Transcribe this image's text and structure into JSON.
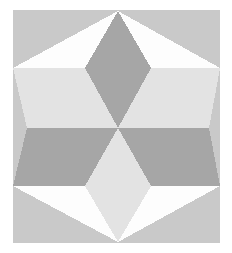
{
  "figure": {
    "title": "Six-Pointed Star Quilt Block",
    "type": "geometric-pattern",
    "canvas": {
      "width": 232,
      "height": 253,
      "page_background": "#ffffff"
    },
    "plate": {
      "label": "pattern-plate",
      "x": 13,
      "y": 10,
      "width": 207,
      "height": 233,
      "background_color": "#c9c9c9"
    },
    "palette": {
      "page_white": "#ffffff",
      "plate_gray": "#c9c9c9",
      "dark_gray": "#a6a6a6",
      "light_gray": "#e3e3e3",
      "void_white": "#fdfdfd"
    },
    "geometry": {
      "top_apex": {
        "x": 118,
        "y": 11
      },
      "center": {
        "x": 118,
        "y": 128
      },
      "bottom_apex": {
        "x": 118,
        "y": 242
      },
      "left_waist": {
        "x": 27,
        "y": 128
      },
      "right_waist": {
        "x": 209,
        "y": 128
      },
      "upper_band_top_y": 68,
      "lower_band_bottom_y": 186,
      "diamond_half_width": 33
    },
    "shapes": [
      {
        "name": "upper-dark-diamond",
        "fill": "#a6a6a6",
        "points": "118,11 151,68 118,128 85,68"
      },
      {
        "name": "upper-left-light-wing",
        "fill": "#e3e3e3",
        "points": "13,68 85,68 118,128 27,128"
      },
      {
        "name": "upper-right-light-wing",
        "fill": "#e3e3e3",
        "points": "151,68 220,68 209,128 118,128"
      },
      {
        "name": "lower-left-dark-wing",
        "fill": "#a6a6a6",
        "points": "27,128 118,128 85,186 13,186"
      },
      {
        "name": "lower-right-dark-wing",
        "fill": "#a6a6a6",
        "points": "118,128 209,128 220,186 151,186"
      },
      {
        "name": "lower-light-diamond",
        "fill": "#e3e3e3",
        "points": "118,128 151,186 118,242 85,186"
      },
      {
        "name": "top-left-white-void",
        "fill": "#fdfdfd",
        "points": "13,68 118,11 85,68"
      },
      {
        "name": "top-right-white-void",
        "fill": "#fdfdfd",
        "points": "118,11 220,68 151,68"
      },
      {
        "name": "bottom-left-white-void",
        "fill": "#fdfdfd",
        "points": "13,186 85,186 118,242"
      },
      {
        "name": "bottom-right-white-void",
        "fill": "#fdfdfd",
        "points": "151,186 220,186 118,242"
      }
    ]
  }
}
